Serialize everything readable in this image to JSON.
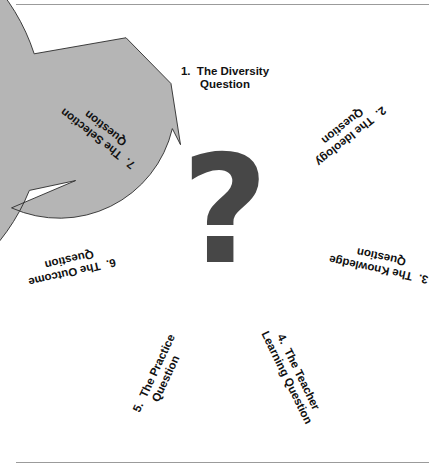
{
  "figure": {
    "center_symbol": "question-mark",
    "rules": {
      "top": "horizontal-rule",
      "bottom": "horizontal-rule"
    }
  },
  "chart_data": {
    "type": "diagram",
    "subtype": "cyclic-chevron-ring",
    "direction": "clockwise",
    "segment_count": 7,
    "center_label": "?",
    "title": "",
    "segments": [
      {
        "number": "1.",
        "name": "The Diversity Question",
        "line1": "1.  The Diversity",
        "line2": "Question",
        "color": "#9a9a9a",
        "text_color": "#111111",
        "start_angle": -25,
        "end_angle": 26,
        "label_angle": 0,
        "orientation": "upright"
      },
      {
        "number": "2.",
        "name": "The Ideology Question",
        "line1": "2.  The Ideology",
        "line2": "Question",
        "color": "#8b8b8b",
        "text_color": "#111111",
        "start_angle": 26,
        "end_angle": 77,
        "label_angle": 51,
        "orientation": "radial"
      },
      {
        "number": "3.",
        "name": "The Knowledge Question",
        "line1": "3.  The Knowledge",
        "line2": "Question",
        "color": "#6e6e6e",
        "text_color": "#111111",
        "start_angle": 77,
        "end_angle": 128,
        "label_angle": 102,
        "orientation": "radial"
      },
      {
        "number": "4.",
        "name": "The Teacher Learning Question",
        "line1": "4.  The Teacher",
        "line2": "Learning Question",
        "color": "#3b3b3b",
        "text_color": "#0a0a0a",
        "start_angle": 128,
        "end_angle": 180,
        "label_angle": 154,
        "orientation": "tangential"
      },
      {
        "number": "5.",
        "name": "The Practice Question",
        "line1": "5.  The Practice",
        "line2": "Question",
        "color": "#ffffff",
        "text_color": "#111111",
        "start_angle": 180,
        "end_angle": 231,
        "label_angle": 205,
        "orientation": "tangential"
      },
      {
        "number": "6.",
        "name": "The Outcome Question",
        "line1": "6.  The Outcome",
        "line2": "Question",
        "color": "#dedede",
        "text_color": "#111111",
        "start_angle": 231,
        "end_angle": 282,
        "label_angle": 257,
        "orientation": "radial"
      },
      {
        "number": "7.",
        "name": "The Selection Question",
        "line1": "7.  The Selection",
        "line2": "Question",
        "color": "#b5b5b5",
        "text_color": "#111111",
        "start_angle": 282,
        "end_angle": 333,
        "label_angle": 308,
        "orientation": "radial"
      }
    ],
    "geometry": {
      "cx": 225,
      "cy": 232,
      "outer_radius": 200,
      "inner_radius": 116,
      "head_extend": 18,
      "notch_depth": 20
    }
  }
}
